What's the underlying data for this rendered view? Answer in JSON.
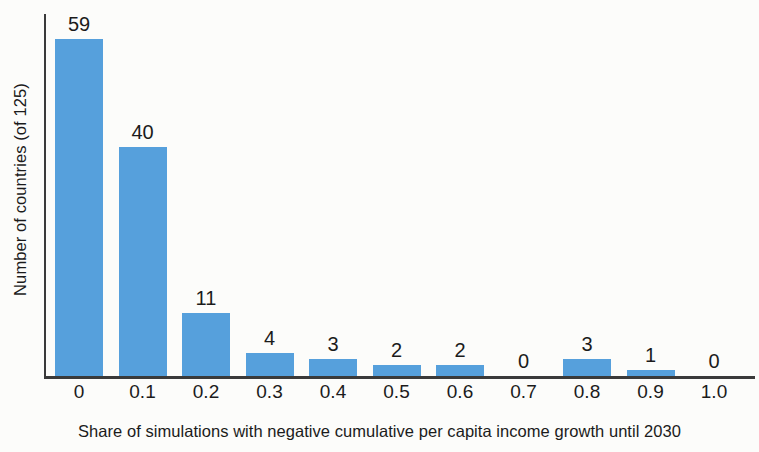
{
  "chart_data": {
    "type": "bar",
    "title": "",
    "subtitle": "",
    "xlabel": "Share of simulations with negative cumulative per capita income growth until 2030",
    "ylabel": "Number of countries (of 125)",
    "categories": [
      "0",
      "0.1",
      "0.2",
      "0.3",
      "0.4",
      "0.5",
      "0.6",
      "0.7",
      "0.8",
      "0.9",
      "1.0"
    ],
    "values": [
      59,
      40,
      11,
      4,
      3,
      2,
      2,
      0,
      3,
      1,
      0
    ],
    "value_labels": [
      "59",
      "40",
      "11",
      "4",
      "3",
      "2",
      "2",
      "0",
      "3",
      "1",
      "0"
    ],
    "ylim": [
      0,
      63
    ],
    "xlim_categories": 11,
    "grid": false,
    "legend": null,
    "bar_color": "#56A0DC",
    "axis_color": "#3a3a3a",
    "text_color": "#1b1b1b",
    "background_color": "#fcfcfa",
    "total_countries": 125
  }
}
